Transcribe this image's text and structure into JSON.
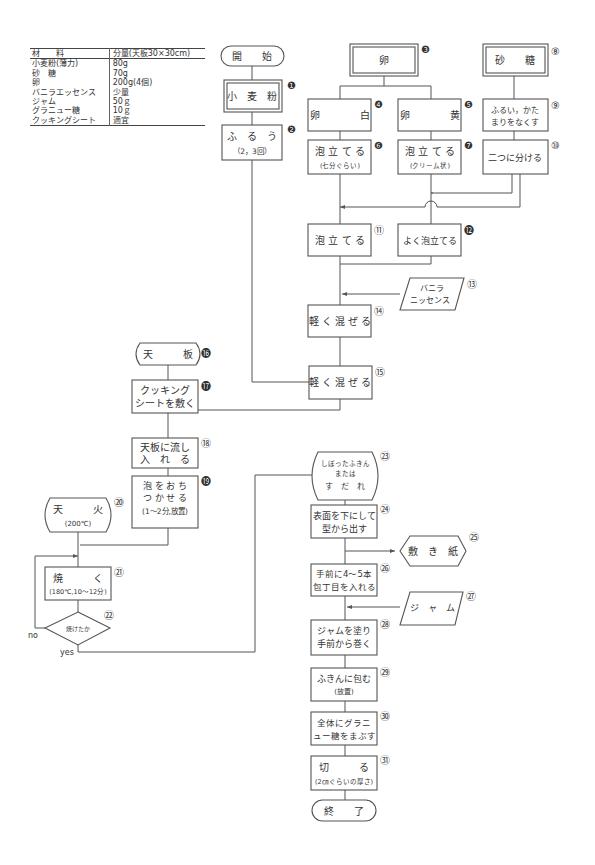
{
  "ingredients": {
    "header": {
      "material": "材　　料",
      "quantity": "分量(天板30×30cm)"
    },
    "rows": [
      {
        "material": "小麦粉(薄力)",
        "quantity": "80g"
      },
      {
        "material": "砂　糖",
        "quantity": "70g"
      },
      {
        "material": "卵",
        "quantity": "200g(4個)"
      },
      {
        "material": "バニラエッセンス",
        "quantity": "少量"
      },
      {
        "material": "ジャム",
        "quantity": "50ｇ"
      },
      {
        "material": "グラニュー糖",
        "quantity": "10ｇ"
      },
      {
        "material": "クッキングシート",
        "quantity": "適宜"
      }
    ]
  },
  "flowchart": {
    "start": "開　　始",
    "end": "終　　了",
    "steps": {
      "s1": {
        "num": "❶",
        "lines": [
          "小　麦　粉"
        ]
      },
      "s2": {
        "num": "❷",
        "lines": [
          "ふ　る　う",
          "（2，3回）"
        ]
      },
      "s3": {
        "num": "❸",
        "lines": [
          "卵"
        ]
      },
      "s4": {
        "num": "❹",
        "lines": [
          "卵　　　　白"
        ]
      },
      "s5": {
        "num": "❺",
        "lines": [
          "卵　　　　黄"
        ]
      },
      "s6": {
        "num": "❻",
        "lines": [
          "泡 立 て る",
          "(七分ぐらい)"
        ]
      },
      "s7": {
        "num": "❼",
        "lines": [
          "泡 立 て る",
          "(クリーム状)"
        ]
      },
      "s8": {
        "num": "⑧",
        "lines": [
          "砂　　糖"
        ]
      },
      "s9": {
        "num": "⑨",
        "lines": [
          "ふるい，かた",
          "まりをなくす"
        ]
      },
      "s10": {
        "num": "⑩",
        "lines": [
          "二つに分ける"
        ]
      },
      "s11": {
        "num": "⑪",
        "lines": [
          "泡 立 て る"
        ]
      },
      "s12": {
        "num": "⓬",
        "lines": [
          "よく泡立てる"
        ]
      },
      "s13": {
        "num": "⑬",
        "lines": [
          "バニラ",
          "ニッセンス"
        ]
      },
      "s14": {
        "num": "⑭",
        "lines": [
          "軽 く 混 ぜ る"
        ]
      },
      "s15": {
        "num": "⑮",
        "lines": [
          "軽 く 混 ぜ る"
        ]
      },
      "s16": {
        "num": "⓰",
        "lines": [
          "天　　　板"
        ]
      },
      "s17": {
        "num": "⓱",
        "lines": [
          "クッキング",
          "シートを敷く"
        ]
      },
      "s18": {
        "num": "⑱",
        "lines": [
          "天板に流し",
          "入　れ　る"
        ]
      },
      "s19": {
        "num": "⓳",
        "lines": [
          "泡 を お ち",
          "つ か せ る",
          "(1～2分,放置)"
        ]
      },
      "s20": {
        "num": "⑳",
        "lines": [
          "天　　　火",
          "(200℃)"
        ]
      },
      "s21": {
        "num": "㉑",
        "lines": [
          "焼　　　く",
          "(180℃,10～12分)"
        ]
      },
      "s22": {
        "num": "㉒",
        "lines": [
          "焼けたか"
        ]
      },
      "s23": {
        "num": "㉓",
        "lines": [
          "しぼったふきん",
          "または",
          "す　だ　れ"
        ]
      },
      "s24": {
        "num": "㉔",
        "lines": [
          "表面を下にして",
          "型から出す"
        ]
      },
      "s25": {
        "num": "㉕",
        "lines": [
          "敷　き　紙"
        ]
      },
      "s26": {
        "num": "㉖",
        "lines": [
          "手前に4～5本",
          "包丁目を入れる"
        ]
      },
      "s27": {
        "num": "㉗",
        "lines": [
          "ジ　ャ　ム"
        ]
      },
      "s28": {
        "num": "㉘",
        "lines": [
          "ジャムを塗り",
          "手前から巻く"
        ]
      },
      "s29": {
        "num": "㉙",
        "lines": [
          "ふきんに包む",
          "(放置)"
        ]
      },
      "s30": {
        "num": "㉚",
        "lines": [
          "全体にグラニ",
          "ュー糖をまぶす"
        ]
      },
      "s31": {
        "num": "㉛",
        "lines": [
          "切　　　る",
          "(2㎝ぐらいの厚さ)"
        ]
      }
    },
    "decision_labels": {
      "no": "no",
      "yes": "yes"
    }
  },
  "colors": {
    "line": "#555555",
    "text": "#333333",
    "background": "#ffffff"
  }
}
